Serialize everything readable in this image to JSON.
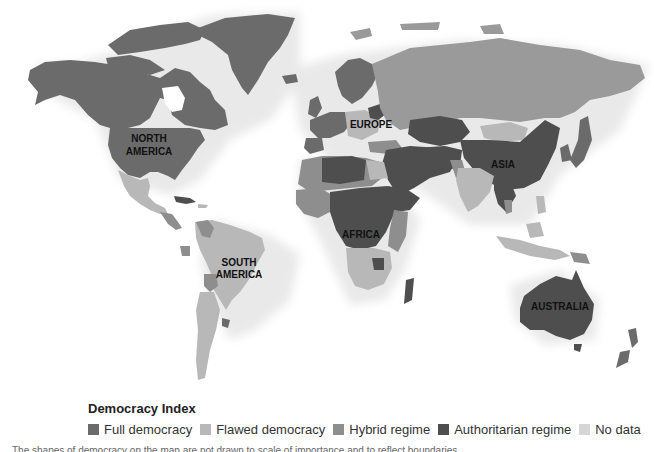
{
  "map": {
    "title": "Democracy Index world map",
    "region_labels": [
      {
        "id": "north-america",
        "lines": [
          "NORTH",
          "AMERICA"
        ]
      },
      {
        "id": "south-america",
        "lines": [
          "SOUTH",
          "AMERICA"
        ]
      },
      {
        "id": "europe",
        "lines": [
          "EUROPE"
        ]
      },
      {
        "id": "africa",
        "lines": [
          "AFRICA"
        ]
      },
      {
        "id": "asia",
        "lines": [
          "ASIA"
        ]
      },
      {
        "id": "australia",
        "lines": [
          "AUSTRALIA"
        ]
      }
    ],
    "labels": {
      "north_america_1": "NORTH",
      "north_america_2": "AMERICA",
      "south_america_1": "SOUTH",
      "south_america_2": "AMERICA",
      "europe": "EUROPE",
      "africa": "AFRICA",
      "asia": "ASIA",
      "australia": "AUSTRALIA"
    }
  },
  "legend": {
    "title": "Democracy Index",
    "items": [
      {
        "label": "Full democracy",
        "color": "#6b6b6b"
      },
      {
        "label": "Flawed democracy",
        "color": "#b8b8b8"
      },
      {
        "label": "Hybrid regime",
        "color": "#8e8e8e"
      },
      {
        "label": "Authoritarian regime",
        "color": "#4e4e4e"
      },
      {
        "label": "No data",
        "color": "#d6d6d6"
      }
    ]
  },
  "colors": {
    "full": "#6b6b6b",
    "flawed": "#b8b8b8",
    "hybrid": "#8e8e8e",
    "authoritarian": "#4e4e4e",
    "nodata": "#d6d6d6",
    "background": "#ffffff"
  },
  "caption": "The shapes of democracy on the map are not drawn to scale of importance and to reflect boundaries"
}
